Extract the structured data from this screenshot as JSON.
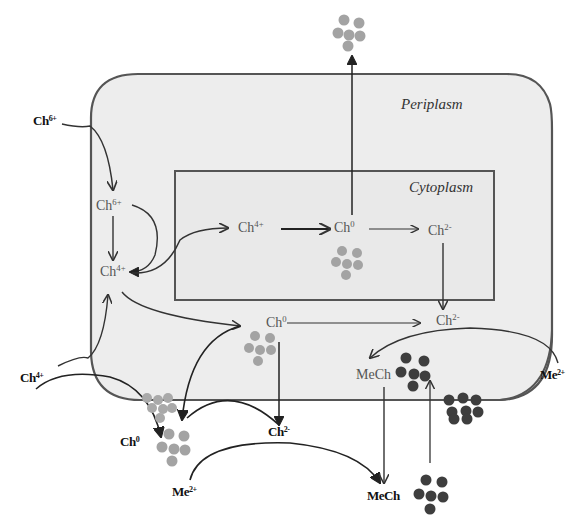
{
  "figure": {
    "type": "cellular-chalcogen-transformation-diagram",
    "colors": {
      "background": "#ffffff",
      "cell_fill": "#ededed",
      "cell_border": "#555555",
      "arrow": "#333333",
      "particles_light": "#a3a3a3",
      "particles_dark": "#3e3e3e"
    }
  },
  "regions": {
    "periplasm": "Periplasm",
    "cytoplasm": "Cytoplasm"
  },
  "species": {
    "ch6_outside": {
      "base": "Ch",
      "charge": "6+"
    },
    "ch6_periplasm": {
      "base": "Ch",
      "charge": "6+"
    },
    "ch4_periplasm": {
      "base": "Ch",
      "charge": "4+"
    },
    "ch4_cytoplasm": {
      "base": "Ch",
      "charge": "4+"
    },
    "ch0_cytoplasm": {
      "base": "Ch",
      "charge": "0"
    },
    "ch2_cytoplasm": {
      "base": "Ch",
      "charge": "2-"
    },
    "ch0_periplasm": {
      "base": "Ch",
      "charge": "0"
    },
    "ch2_periplasm": {
      "base": "Ch",
      "charge": "2-"
    },
    "mech_periplasm": {
      "base": "MeCh",
      "charge": ""
    },
    "me2_outside_right": {
      "base": "Me",
      "charge": "2+"
    },
    "ch4_outside": {
      "base": "Ch",
      "charge": "4+"
    },
    "ch0_outside": {
      "base": "Ch",
      "charge": "0"
    },
    "ch2_outside": {
      "base": "Ch",
      "charge": "2-"
    },
    "me2_outside_bottom": {
      "base": "Me",
      "charge": "2+"
    },
    "mech_outside": {
      "base": "MeCh",
      "charge": ""
    }
  },
  "particles": [
    {
      "id": "ch0-exported-top",
      "tone": "light"
    },
    {
      "id": "ch0-cytoplasm",
      "tone": "light"
    },
    {
      "id": "ch0-periplasm",
      "tone": "light"
    },
    {
      "id": "ch0-membrane-bottom",
      "tone": "light"
    },
    {
      "id": "ch0-outside",
      "tone": "light"
    },
    {
      "id": "mech-periplasm",
      "tone": "dark"
    },
    {
      "id": "mech-membrane-bottom",
      "tone": "dark"
    },
    {
      "id": "mech-outside",
      "tone": "dark"
    }
  ]
}
